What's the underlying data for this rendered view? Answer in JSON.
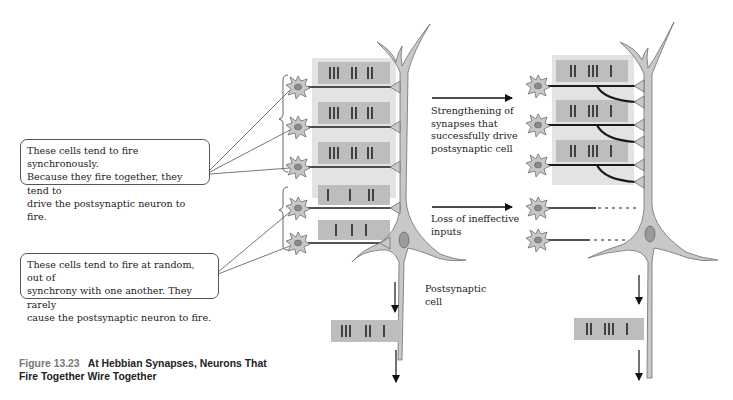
{
  "figure": {
    "number": "Figure 13.23",
    "title_line1": "At Hebbian Synapses, Neurons That",
    "title_line2": "Fire Together Wire Together"
  },
  "callouts": {
    "synchronous": {
      "line1": "These cells tend to fire synchronously.",
      "line2": "Because they fire together, they tend to",
      "line3": "drive the postsynaptic neuron to fire."
    },
    "random": {
      "line1": "These cells tend to fire at random, out of",
      "line2": "synchrony with one another. They rarely",
      "line3": "cause the postsynaptic neuron to fire."
    }
  },
  "labels": {
    "strengthening": {
      "line1": "Strengthening of",
      "line2": "synapses that",
      "line3": "successfully drive",
      "line4": "postsynaptic cell"
    },
    "loss": {
      "line1": "Loss of ineffective",
      "line2": "inputs"
    },
    "postsynaptic": {
      "line1": "Postsynaptic",
      "line2": "cell"
    }
  },
  "spike_trains": {
    "before": {
      "sync_inputs": [
        "III  II  II",
        "III  II  II",
        "III  II  II"
      ],
      "async_inputs": [
        "I   I   II",
        "I  I  I"
      ],
      "output": "III  II  I"
    },
    "after": {
      "sync_inputs": [
        "II  III  I",
        "II  III  I",
        "II  III  I"
      ],
      "output": "II  III  I"
    }
  },
  "colors": {
    "cell_fill": "#c8c8c8",
    "cell_stroke": "#6e6e6e",
    "nucleus": "#8c8c8c",
    "train_box": "#bdbdbd",
    "train_band": "#d9d9d9",
    "axon": "#1a1a1a",
    "text": "#222222",
    "caption_num": "#777777"
  }
}
